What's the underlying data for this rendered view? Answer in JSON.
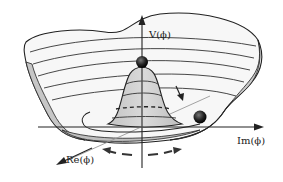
{
  "figure": {
    "axes": {
      "vertical_label": "V(ϕ)",
      "right_label": "Im(ϕ)",
      "front_label": "Re(ϕ)"
    },
    "elements": {
      "ball_top": "unstable equilibrium ball at peak",
      "ball_trough": "ball in degenerate minimum",
      "rolling_arrow": "arrow indicating ball rolling down",
      "circular_arrows": "dashed arrows indicating rotation along trough"
    },
    "colors": {
      "surface_fill": "#f4f4f4",
      "surface_rim": "#c8c8c8",
      "hump_fill": "#cfcfcf",
      "line": "#222222",
      "ball": "#1a1a1a"
    }
  }
}
